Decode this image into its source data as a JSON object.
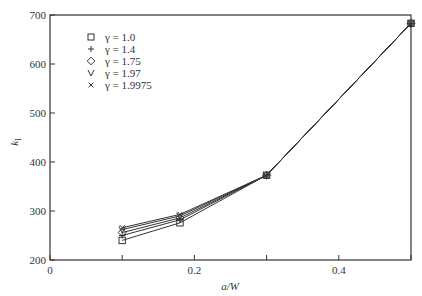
{
  "chart_data": {
    "type": "line",
    "title": "",
    "xlabel": "a/W",
    "ylabel": "k_I",
    "xlim": [
      0,
      0.5
    ],
    "ylim": [
      200,
      700
    ],
    "xticks": [
      0,
      0.1,
      0.2,
      0.3,
      0.4,
      0.5
    ],
    "xtick_labels": [
      "0",
      "",
      "0.2",
      "",
      "0.4",
      ""
    ],
    "yticks": [
      200,
      300,
      400,
      500,
      600,
      700
    ],
    "ytick_labels": [
      "200",
      "300",
      "400",
      "500",
      "600",
      "700"
    ],
    "grid": false,
    "legend_position": "upper-left",
    "x": [
      0.1,
      0.18,
      0.3,
      0.5
    ],
    "series": [
      {
        "name": "γ = 1.0",
        "marker": "square",
        "values": [
          240,
          276,
          373,
          683
        ]
      },
      {
        "name": "γ = 1.4",
        "marker": "plus",
        "values": [
          250,
          282,
          373,
          683
        ]
      },
      {
        "name": "γ = 1.75",
        "marker": "diamond",
        "values": [
          256,
          286,
          373,
          683
        ]
      },
      {
        "name": "γ = 1.97",
        "marker": "v",
        "values": [
          262,
          290,
          373,
          683
        ]
      },
      {
        "name": "γ = 1.9975",
        "marker": "x",
        "values": [
          266,
          293,
          373,
          683
        ]
      }
    ]
  },
  "labels": {
    "xlabel_a": "a",
    "xlabel_rest": "/W",
    "ylabel_k": "k",
    "ylabel_sub": "I"
  }
}
